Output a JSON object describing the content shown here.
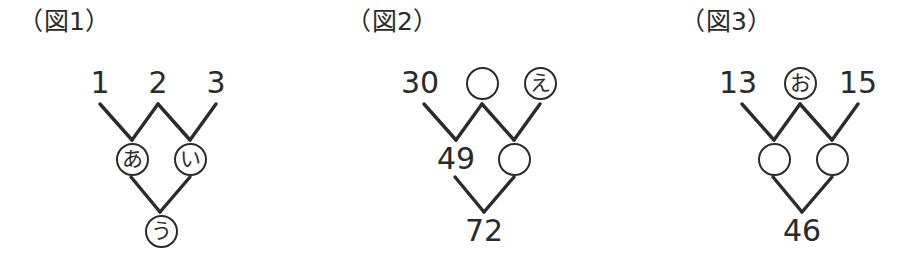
{
  "page": {
    "background_color": "#ffffff",
    "ink_color": "#2b2b2b"
  },
  "figures": [
    {
      "id": "figure-1",
      "caption": "（図1）",
      "caption_left": 18,
      "rows": [
        {
          "level": "top",
          "cells": [
            {
              "kind": "number",
              "text": "1"
            },
            {
              "kind": "number",
              "text": "2"
            },
            {
              "kind": "number",
              "text": "3"
            }
          ]
        },
        {
          "level": "middle",
          "cells": [
            {
              "kind": "circled-kana",
              "text": "あ"
            },
            {
              "kind": "circled-kana",
              "text": "い"
            }
          ]
        },
        {
          "level": "bottom",
          "cells": [
            {
              "kind": "circled-kana",
              "text": "う"
            }
          ]
        }
      ]
    },
    {
      "id": "figure-2",
      "caption": "（図2）",
      "caption_left": 42,
      "rows": [
        {
          "level": "top",
          "cells": [
            {
              "kind": "number",
              "text": "30"
            },
            {
              "kind": "blank-circle",
              "text": ""
            },
            {
              "kind": "circled-kana",
              "text": "え"
            }
          ]
        },
        {
          "level": "middle",
          "cells": [
            {
              "kind": "number",
              "text": "49"
            },
            {
              "kind": "blank-circle",
              "text": ""
            }
          ]
        },
        {
          "level": "bottom",
          "cells": [
            {
              "kind": "number",
              "text": "72"
            }
          ]
        }
      ]
    },
    {
      "id": "figure-3",
      "caption": "（図3）",
      "caption_left": 72,
      "rows": [
        {
          "level": "top",
          "cells": [
            {
              "kind": "number",
              "text": "13"
            },
            {
              "kind": "circled-kana",
              "text": "お"
            },
            {
              "kind": "number",
              "text": "15"
            }
          ]
        },
        {
          "level": "middle",
          "cells": [
            {
              "kind": "blank-circle",
              "text": ""
            },
            {
              "kind": "blank-circle",
              "text": ""
            }
          ]
        },
        {
          "level": "bottom",
          "cells": [
            {
              "kind": "number",
              "text": "46"
            }
          ]
        }
      ]
    }
  ]
}
